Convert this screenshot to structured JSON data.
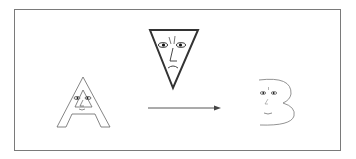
{
  "diagram": {
    "nodes": [
      {
        "id": "A",
        "label": "A",
        "shape": "letter-A-face",
        "expression": "smile"
      },
      {
        "id": "T",
        "label": "triangle",
        "shape": "inverted-triangle-face",
        "expression": "frown"
      },
      {
        "id": "B",
        "label": "B",
        "shape": "letter-B-face",
        "expression": "smile"
      }
    ],
    "edges": [
      {
        "from": "A",
        "to": "B",
        "type": "arrow"
      }
    ],
    "colors": {
      "stroke": "#555555",
      "frame": "#7a7a7a",
      "background": "#ffffff"
    }
  }
}
